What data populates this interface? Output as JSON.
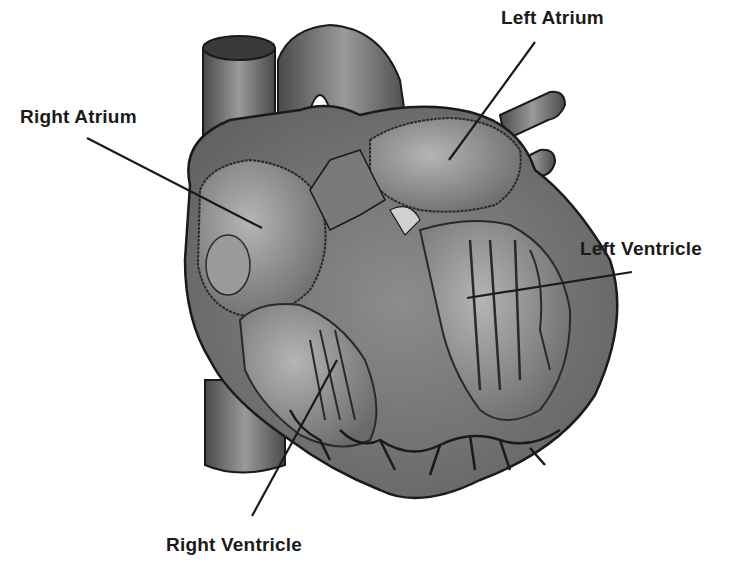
{
  "diagram": {
    "type": "anatomical-illustration",
    "labels": [
      {
        "id": "right-atrium",
        "text": "Right Atrium"
      },
      {
        "id": "left-atrium",
        "text": "Left Atrium"
      },
      {
        "id": "left-ventricle",
        "text": "Left Ventricle"
      },
      {
        "id": "right-ventricle",
        "text": "Right Ventricle"
      }
    ]
  },
  "colors": {
    "background": "#ffffff",
    "outline": "#1a1a1a",
    "tissue_dark": "#5a5a5a",
    "tissue_mid": "#8a8a8a",
    "tissue_light": "#b0b0b0"
  }
}
